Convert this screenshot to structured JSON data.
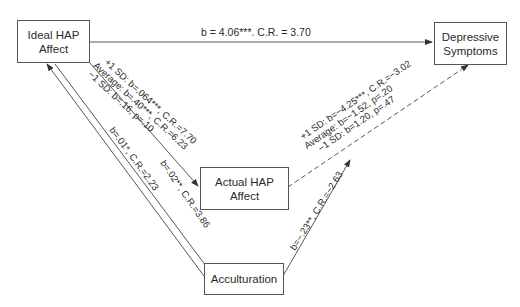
{
  "diagram": {
    "type": "path-model",
    "nodes": {
      "ideal_hap": {
        "line1": "Ideal HAP",
        "line2": "Affect"
      },
      "depressive": {
        "line1": "Depressive",
        "line2": "Symptoms"
      },
      "actual_hap": {
        "line1": "Actual HAP",
        "line2": "Affect"
      },
      "acculturation": {
        "line1": "Acculturation"
      }
    },
    "paths": {
      "ideal_to_depressive": {
        "label": "b = 4.06***. C.R. = 3.70",
        "style": "solid"
      },
      "ideal_to_actual": {
        "lines": [
          "+1 SD: b=.064***, C.R.=7.70",
          "Average: b=.40***, C.R.=6.23",
          "−1 SD: b=.16, p=.10"
        ],
        "style": "solid"
      },
      "actual_to_depressive": {
        "lines": [
          "+1 SD: b=−4.25***, C.R.=−3.02",
          "Average: b=−1.52, p=.20",
          "−1 SD: b=1.20, p=.47"
        ],
        "style": "dashed"
      },
      "acculturation_to_ideal_outer": {
        "label": "b=.01*, C.R.=2.23",
        "style": "solid"
      },
      "acculturation_to_ideal_inner": {
        "label": "b=.02**, C.R.=3.86",
        "style": "solid"
      },
      "acculturation_to_depressive": {
        "label": "b=−.23**, C.R.=−2.63",
        "style": "solid"
      }
    }
  }
}
